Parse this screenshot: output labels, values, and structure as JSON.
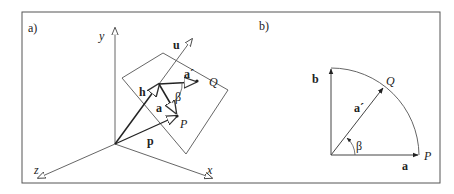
{
  "figure": {
    "panel_a": {
      "label": "a)",
      "axes": {
        "x": "x",
        "y": "y",
        "z": "z"
      },
      "vectors": {
        "u": "u",
        "h": "h",
        "a": "a",
        "a_prime": "a´",
        "p": "p"
      },
      "points": {
        "P": "P",
        "Q": "Q"
      },
      "angle": "β"
    },
    "panel_b": {
      "label": "b)",
      "vectors": {
        "a": "a",
        "b": "b",
        "a_prime": "a´"
      },
      "points": {
        "P": "P",
        "Q": "Q"
      },
      "angle": "β"
    }
  }
}
